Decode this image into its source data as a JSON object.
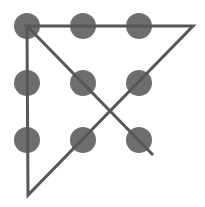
{
  "diagram": {
    "colors": {
      "background": "#ffffff",
      "dot": "#6e6e6e",
      "line": "#575757"
    },
    "dot_radius": 13,
    "line_width": 3,
    "dots": [
      {
        "row": 0,
        "col": 0,
        "cx": 27,
        "cy": 26
      },
      {
        "row": 0,
        "col": 1,
        "cx": 83,
        "cy": 26
      },
      {
        "row": 0,
        "col": 2,
        "cx": 139,
        "cy": 26
      },
      {
        "row": 1,
        "col": 0,
        "cx": 27,
        "cy": 83
      },
      {
        "row": 1,
        "col": 1,
        "cx": 83,
        "cy": 83
      },
      {
        "row": 1,
        "col": 2,
        "cx": 139,
        "cy": 83
      },
      {
        "row": 2,
        "col": 0,
        "cx": 27,
        "cy": 140
      },
      {
        "row": 2,
        "col": 1,
        "cx": 83,
        "cy": 140
      },
      {
        "row": 2,
        "col": 2,
        "cx": 139,
        "cy": 140
      }
    ],
    "path": [
      {
        "x": 153,
        "y": 155
      },
      {
        "x": 27,
        "y": 26
      },
      {
        "x": 193,
        "y": 26
      },
      {
        "x": 28,
        "y": 195
      },
      {
        "x": 27,
        "y": 26
      }
    ]
  }
}
